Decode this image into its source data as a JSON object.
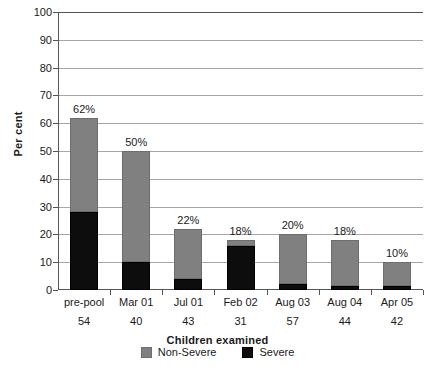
{
  "chart_data": {
    "type": "bar",
    "stacked": true,
    "title": "",
    "xlabel": "Children examined",
    "ylabel": "Per cent",
    "ylim": [
      0,
      100
    ],
    "ytick_step": 10,
    "yticks": [
      0,
      10,
      20,
      30,
      40,
      50,
      60,
      70,
      80,
      90,
      100
    ],
    "ytick_labels": [
      "0",
      "10",
      "20",
      "30",
      "40",
      "50",
      "60",
      "70",
      "80",
      "90",
      "100"
    ],
    "grid": "horizontal",
    "legend_position": "bottom",
    "categories": [
      "pre-pool",
      "Mar 01",
      "Jul 01",
      "Feb 02",
      "Aug 03",
      "Aug 04",
      "Apr 05"
    ],
    "category_counts": [
      "54",
      "40",
      "43",
      "31",
      "57",
      "44",
      "42"
    ],
    "series": [
      {
        "name": "Severe",
        "color": "#0d0d0d",
        "values": [
          28,
          10,
          4,
          16,
          2,
          1.5,
          1.5
        ]
      },
      {
        "name": "Non-Severe",
        "color": "#808080",
        "values": [
          34,
          40,
          18,
          2,
          18,
          16.5,
          8.5
        ]
      }
    ],
    "totals": [
      62,
      50,
      22,
      18,
      20,
      18,
      10
    ],
    "total_labels": [
      "62%",
      "50%",
      "22%",
      "18%",
      "20%",
      "18%",
      "10%"
    ],
    "axis_color": "#555555",
    "gridline_color": "#a6a6a6"
  },
  "legend": {
    "items": [
      {
        "label": "Non-Severe",
        "key": "nonsevere"
      },
      {
        "label": "Severe",
        "key": "severe"
      }
    ]
  }
}
